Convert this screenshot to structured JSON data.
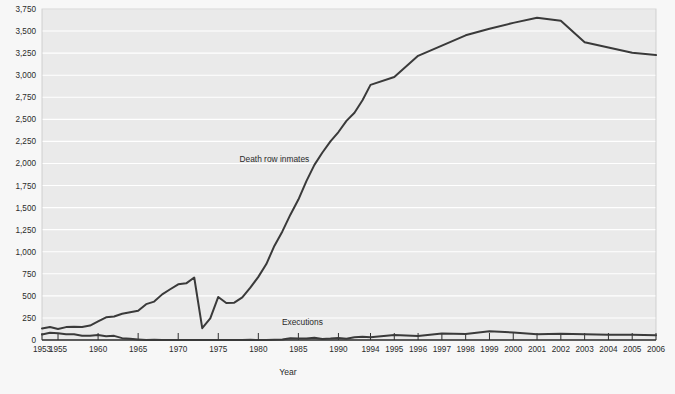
{
  "chart_data": {
    "type": "line",
    "title": "",
    "xlabel": "Year",
    "ylabel": "",
    "ylim": [
      0,
      3750
    ],
    "ytick_values": [
      0,
      250,
      500,
      750,
      1000,
      1250,
      1500,
      1750,
      2000,
      2250,
      2500,
      2750,
      3000,
      3250,
      3500,
      3750
    ],
    "ytick_labels": [
      "0",
      "250",
      "500",
      "750",
      "1,000",
      "1,250",
      "1,500",
      "1,750",
      "2,000",
      "2,250",
      "2,500",
      "2,750",
      "3,000",
      "3,250",
      "3,500",
      "3,750"
    ],
    "xtick_labels": [
      "1953",
      "1955",
      "1960",
      "1965",
      "1970",
      "1975",
      "1980",
      "1985",
      "1990",
      "1994",
      "1995",
      "1996",
      "1997",
      "1998",
      "1999",
      "2000",
      "2001",
      "2002",
      "2003",
      "2004",
      "2005",
      "2006"
    ],
    "grid": true,
    "legend_position": "inline-annotation",
    "annotations": [
      {
        "text": "Death row inmates",
        "year": 1982.0,
        "value": 2020
      },
      {
        "text": "Executions",
        "year": 1985.5,
        "value": 175
      }
    ],
    "series": [
      {
        "name": "Death row inmates",
        "color": "#3a3a3a",
        "x": [
          1953,
          1954,
          1955,
          1956,
          1957,
          1958,
          1959,
          1960,
          1961,
          1962,
          1963,
          1964,
          1965,
          1966,
          1967,
          1968,
          1969,
          1970,
          1971,
          1972,
          1973,
          1974,
          1975,
          1976,
          1977,
          1978,
          1979,
          1980,
          1981,
          1982,
          1983,
          1984,
          1985,
          1986,
          1987,
          1988,
          1989,
          1990,
          1991,
          1992,
          1993,
          1994,
          1995,
          1996,
          1997,
          1998,
          1999,
          2000,
          2001,
          2002,
          2003,
          2004,
          2005,
          2006
        ],
        "values": [
          131,
          147,
          125,
          146,
          151,
          147,
          164,
          210,
          257,
          267,
          297,
          315,
          331,
          406,
          435,
          517,
          575,
          631,
          642,
          708,
          134,
          244,
          488,
          420,
          423,
          482,
          593,
          715,
          860,
          1066,
          1230,
          1420,
          1591,
          1800,
          1984,
          2124,
          2250,
          2356,
          2482,
          2575,
          2716,
          2890,
          2979,
          3219,
          3335,
          3452,
          3527,
          3593,
          3652,
          3617,
          3374,
          3315,
          3254,
          3228
        ]
      },
      {
        "name": "Executions",
        "color": "#3a3a3a",
        "x": [
          1953,
          1954,
          1955,
          1956,
          1957,
          1958,
          1959,
          1960,
          1961,
          1962,
          1963,
          1964,
          1965,
          1966,
          1967,
          1968,
          1969,
          1970,
          1971,
          1972,
          1973,
          1974,
          1975,
          1976,
          1977,
          1978,
          1979,
          1980,
          1981,
          1982,
          1983,
          1984,
          1985,
          1986,
          1987,
          1988,
          1989,
          1990,
          1991,
          1992,
          1993,
          1994,
          1995,
          1996,
          1997,
          1998,
          1999,
          2000,
          2001,
          2002,
          2003,
          2004,
          2005,
          2006
        ],
        "values": [
          62,
          81,
          76,
          65,
          65,
          49,
          49,
          56,
          42,
          47,
          21,
          15,
          7,
          1,
          2,
          0,
          0,
          0,
          0,
          0,
          0,
          0,
          0,
          0,
          1,
          0,
          2,
          0,
          1,
          2,
          5,
          21,
          18,
          18,
          25,
          11,
          16,
          23,
          14,
          31,
          38,
          31,
          56,
          45,
          74,
          68,
          98,
          85,
          66,
          71,
          65,
          59,
          60,
          53
        ]
      }
    ]
  }
}
